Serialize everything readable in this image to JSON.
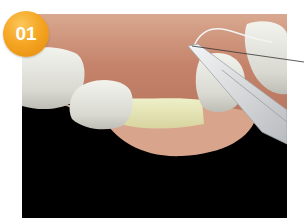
{
  "figure": {
    "step_badge": "01",
    "colors": {
      "badge": "#f5a623",
      "badge_text": "#ffffff",
      "background": "#000000",
      "gum": "#c98a72",
      "tooth": "#e9e8e0",
      "bone": "#e7e3b8",
      "instrument": "#d8dadc",
      "callout_line": "#333333"
    }
  }
}
